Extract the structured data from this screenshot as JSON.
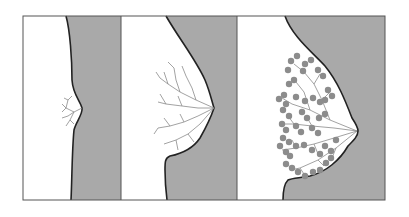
{
  "figure": {
    "colors": {
      "background": "#ffffff",
      "tissue_fill": "#a9a9a9",
      "outline": "#222222",
      "frame": "#555555",
      "ducts": "#8a8a8a",
      "lobules": "#8c8c8c"
    },
    "panels": [
      {
        "id": "panel-1",
        "stage": "prepubertal",
        "label": ""
      },
      {
        "id": "panel-2",
        "stage": "ductal-growth",
        "label": ""
      },
      {
        "id": "panel-3",
        "stage": "lobular-development",
        "label": ""
      }
    ]
  }
}
